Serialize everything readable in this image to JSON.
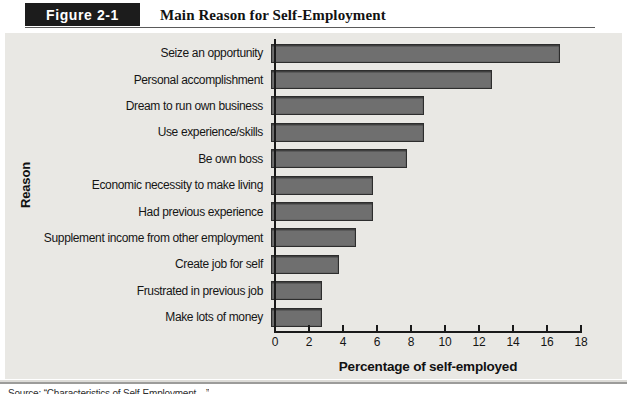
{
  "header": {
    "figure_label": "Figure 2-1",
    "title": "Main Reason for Self-Employment"
  },
  "chart_data": {
    "type": "bar",
    "orientation": "horizontal",
    "title": "Main Reason for Self-Employment",
    "categories": [
      "Seize an opportunity",
      "Personal accomplishment",
      "Dream to run own business",
      "Use experience/skills",
      "Be own boss",
      "Economic necessity to make living",
      "Had previous experience",
      "Supplement income from other employment",
      "Create job for self",
      "Frustrated in previous job",
      "Make lots of money"
    ],
    "values": [
      17,
      13,
      9,
      9,
      8,
      6,
      6,
      5,
      4,
      3,
      3
    ],
    "xlabel": "Percentage of self-employed",
    "ylabel": "Reason",
    "xlim": [
      0,
      18
    ],
    "xticks": [
      0,
      2,
      4,
      6,
      8,
      10,
      12,
      14,
      16,
      18
    ],
    "grid": false,
    "legend": "none",
    "bar_color": "#6f6f6f",
    "bar_border_color": "#2d2d2d",
    "plot_bg_color": "#e9e8e4",
    "badge_bg_color": "#1c1c1c"
  },
  "footer": {
    "source_note": "Source: “Characteristics of Self-Employment…”"
  }
}
